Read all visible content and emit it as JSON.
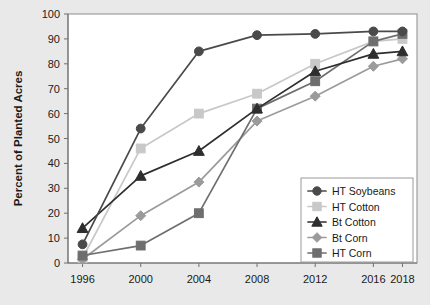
{
  "chart_data": {
    "type": "line",
    "title": "",
    "xlabel": "",
    "ylabel": "Percent of Planted Acres",
    "categories": [
      "1996",
      "2000",
      "2004",
      "2008",
      "2012",
      "2016",
      "2018"
    ],
    "x": [
      1996,
      2000,
      2004,
      2008,
      2012,
      2016,
      2018
    ],
    "xlim": [
      1995,
      2019
    ],
    "ylim": [
      0,
      100
    ],
    "ytick_step": 10,
    "yticks": [
      "0",
      "10",
      "20",
      "30",
      "40",
      "50",
      "60",
      "70",
      "80",
      "90",
      "100"
    ],
    "grid": false,
    "legend_position": "bottom-right",
    "series": [
      {
        "name": "HT Soybeans",
        "marker": "circle",
        "color": "#4a4a4a",
        "values": [
          7.5,
          54,
          85,
          91.5,
          92,
          93,
          93
        ]
      },
      {
        "name": "HT Cotton",
        "marker": "square",
        "color": "#c8c8c8",
        "values": [
          2,
          46,
          60,
          68,
          80,
          89,
          90
        ]
      },
      {
        "name": "Bt Cotton",
        "marker": "triangle",
        "color": "#2e2e2e",
        "values": [
          14,
          35,
          45,
          62,
          77,
          84,
          85
        ]
      },
      {
        "name": "Bt Corn",
        "marker": "diamond",
        "color": "#9b9b9b",
        "values": [
          1.5,
          19,
          32.5,
          57,
          67,
          79,
          82
        ]
      },
      {
        "name": "HT Corn",
        "marker": "square",
        "color": "#6e6e6e",
        "values": [
          3,
          7,
          20,
          62,
          73,
          89,
          92
        ]
      }
    ]
  },
  "legend": {
    "items": [
      {
        "label": "HT Soybeans"
      },
      {
        "label": "HT Cotton"
      },
      {
        "label": "Bt Cotton"
      },
      {
        "label": "Bt Corn"
      },
      {
        "label": "HT Corn"
      }
    ]
  }
}
